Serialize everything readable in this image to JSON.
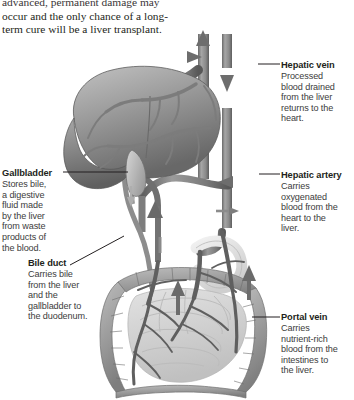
{
  "figure": {
    "type": "anatomical-diagram"
  },
  "intro_paragraph": {
    "lines": [
      "advanced, permanent damage may",
      "occur and the only chance of a long-",
      "term cure will be a liver transplant."
    ]
  },
  "callouts": [
    {
      "id": "hepatic-vein",
      "title": "Hepatic vein",
      "lines": [
        "Processed",
        "blood drained",
        "from the liver",
        "returns to the",
        "heart."
      ]
    },
    {
      "id": "hepatic-artery",
      "title": "Hepatic artery",
      "lines": [
        "Carries",
        "oxygenated",
        "blood from the",
        "heart to the",
        "liver."
      ]
    },
    {
      "id": "portal-vein",
      "title": "Portal vein",
      "lines": [
        "Carries",
        "nutrient-rich",
        "blood from the",
        "intestines to",
        "the liver."
      ]
    },
    {
      "id": "gallbladder",
      "title": "Gallbladder",
      "lines": [
        "Stores bile,",
        "a digestive",
        "fluid made",
        "by the liver",
        "from waste",
        "products of",
        "the blood."
      ]
    },
    {
      "id": "bile-duct",
      "title": "Bile duct",
      "lines": [
        "Carries bile",
        "from the liver",
        "and the",
        "gallbladder to",
        "the duodenum."
      ]
    }
  ],
  "organs": [
    {
      "id": "liver",
      "name": "liver"
    },
    {
      "id": "gallbladder-organ",
      "name": "gallbladder"
    },
    {
      "id": "stomach-duodenum",
      "name": "duodenum"
    },
    {
      "id": "large-intestine",
      "name": "large intestine"
    },
    {
      "id": "small-intestine",
      "name": "small intestine"
    }
  ],
  "vessels": [
    {
      "id": "hepatic-vein-vessel",
      "name": "hepatic vein",
      "flow": "up"
    },
    {
      "id": "vena-cava-vessel",
      "name": "inferior vena cava",
      "flow": "down"
    },
    {
      "id": "hepatic-artery-vessel",
      "name": "hepatic artery",
      "flow": "left"
    },
    {
      "id": "portal-vein-vessel",
      "name": "portal vein",
      "flow": "up"
    },
    {
      "id": "bile-duct-vessel",
      "name": "bile duct",
      "flow": "down"
    }
  ],
  "colors": {
    "text": "#231f20",
    "body_text": "#3c3c3c",
    "vessel_dark": "#6e6e6e",
    "vessel_mid": "#8c8c8c",
    "liver_dark": "#6f6f6f",
    "liver_light": "#b8b8b8",
    "intestine": "#9a9a9a",
    "background": "#ffffff"
  }
}
